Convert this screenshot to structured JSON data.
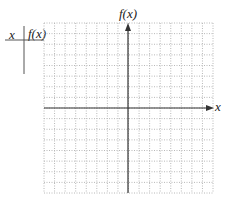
{
  "table": {
    "header_x": "x",
    "header_fx": "f(x)"
  },
  "graph": {
    "y_axis_label": "f(x)",
    "x_axis_label": "x",
    "grid_cells_x": 16,
    "grid_cells_y": 16,
    "grid_color": "#b8b8b8",
    "axis_color": "#333333"
  }
}
